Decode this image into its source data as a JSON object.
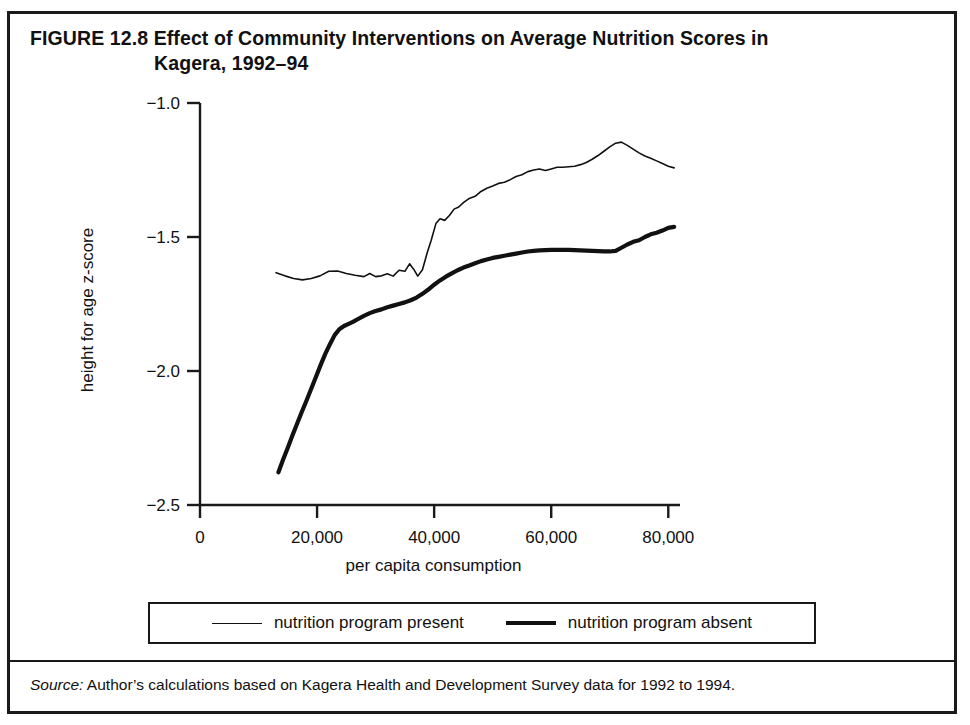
{
  "figure": {
    "label": "FIGURE 12.8",
    "title_line1": "Effect of Community Interventions on Average Nutrition Scores in",
    "title_line2": "Kagera, 1992–94",
    "source_prefix": "Source:",
    "source_text": " Author’s calculations based on Kagera Health and Development Survey data for 1992 to 1994."
  },
  "legend": {
    "series1_label": "nutrition program present",
    "series2_label": "nutrition program absent"
  },
  "chart_data": {
    "type": "line",
    "title": "Effect of Community Interventions on Average Nutrition Scores in Kagera, 1992–94",
    "xlabel": "per capita consumption",
    "ylabel": "height for age z-score",
    "xlim": [
      0,
      82000
    ],
    "ylim": [
      -2.5,
      -1.0
    ],
    "xticks": [
      0,
      20000,
      40000,
      60000,
      80000
    ],
    "xtick_labels": [
      "0",
      "20,000",
      "40,000",
      "60,000",
      "80,000"
    ],
    "yticks": [
      -1.0,
      -1.5,
      -2.0,
      -2.5
    ],
    "ytick_labels": [
      "−1.0",
      "−1.5",
      "−2.0",
      "−2.5"
    ],
    "grid": false,
    "legend_position": "below-plot",
    "line_color": "#111111",
    "series": [
      {
        "name": "nutrition program present",
        "style": "thin",
        "linewidth": 1.6,
        "x": [
          13000,
          14500,
          16000,
          17500,
          19000,
          20500,
          22000,
          23500,
          25000,
          26500,
          28000,
          29000,
          30000,
          31000,
          32000,
          33000,
          34000,
          35000,
          35800,
          36500,
          37200,
          38000,
          38800,
          39500,
          40300,
          41000,
          41800,
          42600,
          43400,
          44200,
          45000,
          46000,
          47000,
          48000,
          49000,
          50000,
          51000,
          52000,
          53000,
          54000,
          55000,
          56000,
          57000,
          58000,
          59000,
          60000,
          61000,
          62000,
          63000,
          64000,
          65000,
          66000,
          67000,
          68000,
          69000,
          70000,
          71000,
          72000,
          73000,
          74000,
          75000,
          76000,
          77000,
          78000,
          79000,
          80000,
          81000
        ],
        "y": [
          -1.633,
          -1.645,
          -1.655,
          -1.66,
          -1.655,
          -1.645,
          -1.628,
          -1.627,
          -1.636,
          -1.643,
          -1.648,
          -1.636,
          -1.648,
          -1.645,
          -1.637,
          -1.646,
          -1.624,
          -1.628,
          -1.6,
          -1.62,
          -1.646,
          -1.622,
          -1.56,
          -1.512,
          -1.45,
          -1.432,
          -1.438,
          -1.42,
          -1.396,
          -1.388,
          -1.372,
          -1.356,
          -1.348,
          -1.33,
          -1.318,
          -1.31,
          -1.3,
          -1.296,
          -1.286,
          -1.274,
          -1.268,
          -1.256,
          -1.25,
          -1.246,
          -1.252,
          -1.246,
          -1.24,
          -1.24,
          -1.238,
          -1.236,
          -1.23,
          -1.222,
          -1.21,
          -1.196,
          -1.18,
          -1.164,
          -1.15,
          -1.146,
          -1.158,
          -1.172,
          -1.186,
          -1.198,
          -1.206,
          -1.216,
          -1.226,
          -1.236,
          -1.242
        ]
      },
      {
        "name": "nutrition program absent",
        "style": "thick",
        "linewidth": 4.2,
        "x": [
          13400,
          14200,
          15000,
          15800,
          16600,
          17400,
          18200,
          19000,
          19800,
          20600,
          21400,
          22200,
          23000,
          23800,
          24600,
          25400,
          26200,
          27000,
          28000,
          29000,
          30000,
          31000,
          32000,
          33000,
          34000,
          35000,
          36000,
          37000,
          38000,
          39000,
          40000,
          41000,
          42000,
          43000,
          44000,
          45000,
          46000,
          47000,
          48000,
          49000,
          50000,
          51000,
          52000,
          53000,
          54000,
          55000,
          56000,
          57000,
          58000,
          59000,
          60000,
          61000,
          62000,
          63000,
          64000,
          65000,
          66000,
          67000,
          68000,
          69000,
          70000,
          71000,
          72000,
          73000,
          74000,
          75000,
          76000,
          77000,
          78000,
          79000,
          80000,
          81000
        ],
        "y": [
          -2.378,
          -2.33,
          -2.286,
          -2.24,
          -2.196,
          -2.152,
          -2.11,
          -2.066,
          -2.022,
          -1.978,
          -1.936,
          -1.9,
          -1.866,
          -1.844,
          -1.832,
          -1.824,
          -1.816,
          -1.806,
          -1.794,
          -1.784,
          -1.776,
          -1.77,
          -1.762,
          -1.756,
          -1.75,
          -1.744,
          -1.736,
          -1.726,
          -1.712,
          -1.696,
          -1.678,
          -1.662,
          -1.648,
          -1.636,
          -1.624,
          -1.614,
          -1.606,
          -1.598,
          -1.59,
          -1.584,
          -1.578,
          -1.574,
          -1.57,
          -1.566,
          -1.562,
          -1.558,
          -1.554,
          -1.552,
          -1.55,
          -1.549,
          -1.548,
          -1.548,
          -1.548,
          -1.548,
          -1.549,
          -1.55,
          -1.551,
          -1.552,
          -1.553,
          -1.554,
          -1.554,
          -1.552,
          -1.54,
          -1.528,
          -1.518,
          -1.512,
          -1.5,
          -1.49,
          -1.484,
          -1.476,
          -1.466,
          -1.462
        ]
      }
    ]
  }
}
